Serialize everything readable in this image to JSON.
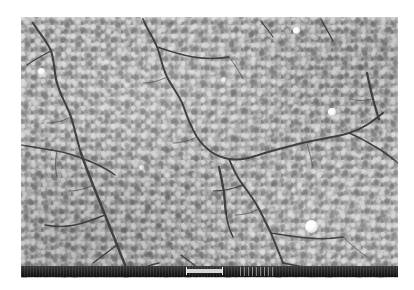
{
  "figure": {
    "kind": "sem-micrograph",
    "caption": "",
    "background_color": "#ffffff"
  },
  "micrograph": {
    "label": "SEM micrograph of cracked nanoparticle film",
    "frame": {
      "x": 21,
      "y": 17,
      "width": 377,
      "height": 261
    },
    "base_gray": "#a8a8a8",
    "grain_light": "#dcdcdc",
    "grain_dark": "#7e7e7e",
    "crack_color": "#3a3a3a",
    "description": "Densely packed granular nanoparticle surface traversed by a branching network of dark drying cracks",
    "bright_particles": [
      {
        "name": "bright-particle-1",
        "x": 17,
        "y": 51,
        "size": 7
      },
      {
        "name": "bright-particle-2",
        "x": 272,
        "y": 10,
        "size": 7
      },
      {
        "name": "bright-particle-3",
        "x": 307,
        "y": 91,
        "size": 8
      },
      {
        "name": "bright-particle-4",
        "x": 284,
        "y": 203,
        "size": 13
      },
      {
        "name": "bright-particle-5",
        "x": 118,
        "y": 148,
        "size": 5
      },
      {
        "name": "bright-particle-6",
        "x": 200,
        "y": 60,
        "size": 5
      }
    ]
  },
  "info_bar": {
    "name": "instrument-info-bar",
    "color": "#1a1a1a",
    "scale_bar": {
      "name": "scale-bar",
      "color": "#d8d8d8",
      "x": 165,
      "y": 3,
      "width": 37,
      "height": 4,
      "label": ""
    },
    "marks_label": ""
  }
}
